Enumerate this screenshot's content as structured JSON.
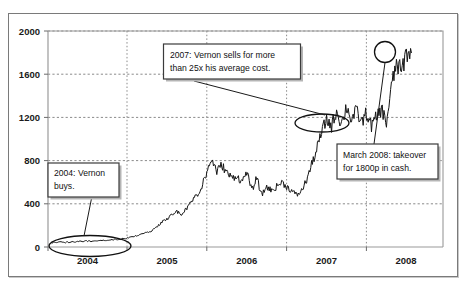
{
  "chart_data": {
    "type": "line",
    "title": "",
    "xlabel": "",
    "ylabel": "",
    "xlim": [
      2003.75,
      2008.5
    ],
    "ylim": [
      0,
      2000
    ],
    "grid": true,
    "legend": null,
    "y_ticks": [
      "0",
      "400",
      "800",
      "1200",
      "1600",
      "2000"
    ],
    "y_tick_values": [
      0,
      400,
      800,
      1200,
      1600,
      2000
    ],
    "x_ticks": [
      "2004",
      "2005",
      "2006",
      "2007",
      "2008"
    ],
    "x_tick_values": [
      2004,
      2005,
      2006,
      2007,
      2008
    ],
    "series": [
      {
        "name": "Share price (pence)",
        "x": [
          2003.8,
          2003.88,
          2003.96,
          2004.04,
          2004.12,
          2004.2,
          2004.28,
          2004.36,
          2004.44,
          2004.52,
          2004.6,
          2004.68,
          2004.76,
          2004.84,
          2004.92,
          2005.0,
          2005.06,
          2005.12,
          2005.18,
          2005.24,
          2005.3,
          2005.36,
          2005.42,
          2005.48,
          2005.54,
          2005.6,
          2005.66,
          2005.72,
          2005.78,
          2005.84,
          2005.9,
          2005.96,
          2006.02,
          2006.08,
          2006.14,
          2006.2,
          2006.26,
          2006.32,
          2006.38,
          2006.44,
          2006.5,
          2006.56,
          2006.62,
          2006.68,
          2006.74,
          2006.8,
          2006.86,
          2006.92,
          2006.98,
          2007.04,
          2007.1,
          2007.16,
          2007.22,
          2007.28,
          2007.34,
          2007.4,
          2007.46,
          2007.52,
          2007.58,
          2007.64,
          2007.7,
          2007.76,
          2007.82,
          2007.88,
          2007.94,
          2008.0,
          2008.06,
          2008.12
        ],
        "y": [
          40,
          45,
          42,
          48,
          50,
          55,
          52,
          60,
          58,
          66,
          72,
          80,
          95,
          110,
          130,
          150,
          190,
          230,
          260,
          300,
          330,
          300,
          360,
          420,
          480,
          560,
          700,
          810,
          700,
          760,
          690,
          640,
          660,
          600,
          700,
          520,
          640,
          480,
          560,
          520,
          560,
          600,
          560,
          520,
          480,
          520,
          620,
          760,
          900,
          1060,
          1180,
          1120,
          1260,
          1140,
          1300,
          1180,
          1260,
          1150,
          1240,
          1120,
          1200,
          1280,
          1150,
          1480,
          1700,
          1620,
          1800,
          1800
        ]
      }
    ],
    "annotations": [
      {
        "id": "annotation-2004-buys",
        "text": "2004: Vernon buys.",
        "lines": [
          "2004: Vernon",
          "buys."
        ],
        "highlight": "ellipse around early-2004 low price region"
      },
      {
        "id": "annotation-2007-sells",
        "text": "2007: Vernon sells for more than 25x his average cost.",
        "lines": [
          "2007: Vernon  sells for  more",
          "than 25x his average cost."
        ],
        "highlight": "ellipse around 2007 price plateau near 1200"
      },
      {
        "id": "annotation-2008-takeover",
        "text": "March 2008: takeover for 1800p in cash.",
        "lines": [
          "March 2008: takeover",
          "for 1800p in cash."
        ],
        "highlight": "circle marker at final price 1800"
      }
    ],
    "markers": [
      {
        "name": "ellipse-2004-buy-zone",
        "shape": "ellipse"
      },
      {
        "name": "ellipse-2007-sell-zone",
        "shape": "ellipse"
      },
      {
        "name": "circle-2008-takeover-price",
        "shape": "circle"
      }
    ]
  },
  "colors": {
    "series": "#151515",
    "grid": "#8a8a8a",
    "frame": "#7a7a7a",
    "text": "#111111",
    "background": "#ffffff"
  }
}
